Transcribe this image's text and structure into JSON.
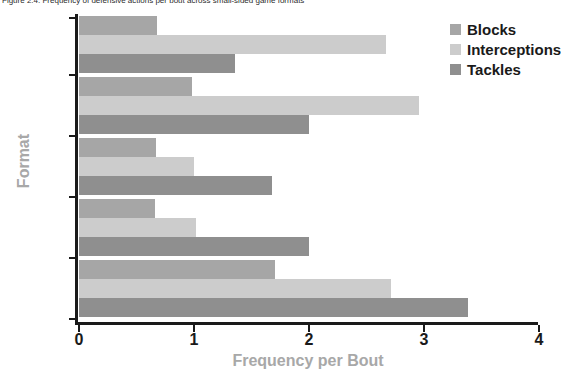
{
  "caption": "Figure 2.4. Frequency of defensive actions per bout across small-sided game formats",
  "chart_data": {
    "type": "bar",
    "orientation": "horizontal",
    "title": "",
    "xlabel": "Frequency per Bout",
    "ylabel": "Format",
    "categories": [
      "1v1",
      "2v2",
      "3v3",
      "4v4",
      "5v5"
    ],
    "category_order_top_to_bottom": [
      "5v5",
      "4v4",
      "3v3",
      "2v2",
      "1v1"
    ],
    "series": [
      {
        "name": "Blocks",
        "color": "#a6a6a6",
        "values": [
          1.7,
          0.66,
          0.67,
          0.98,
          0.68
        ]
      },
      {
        "name": "Interceptions",
        "color": "#cccccc",
        "values": [
          2.71,
          1.02,
          1.0,
          2.96,
          2.67
        ]
      },
      {
        "name": "Tackles",
        "color": "#8f8f8f",
        "values": [
          3.38,
          2.0,
          1.68,
          2.0,
          1.36
        ]
      }
    ],
    "xlim": [
      0,
      4
    ],
    "xticks": [
      0,
      1,
      2,
      3,
      4
    ],
    "xtick_labels": [
      "0",
      "1",
      "2",
      "3",
      "4"
    ],
    "grid": false,
    "legend_position": "top-right",
    "axis_label_color": "#a8a8a8",
    "tick_label_color": "#1a1a1a",
    "background_color": "#ffffff"
  }
}
